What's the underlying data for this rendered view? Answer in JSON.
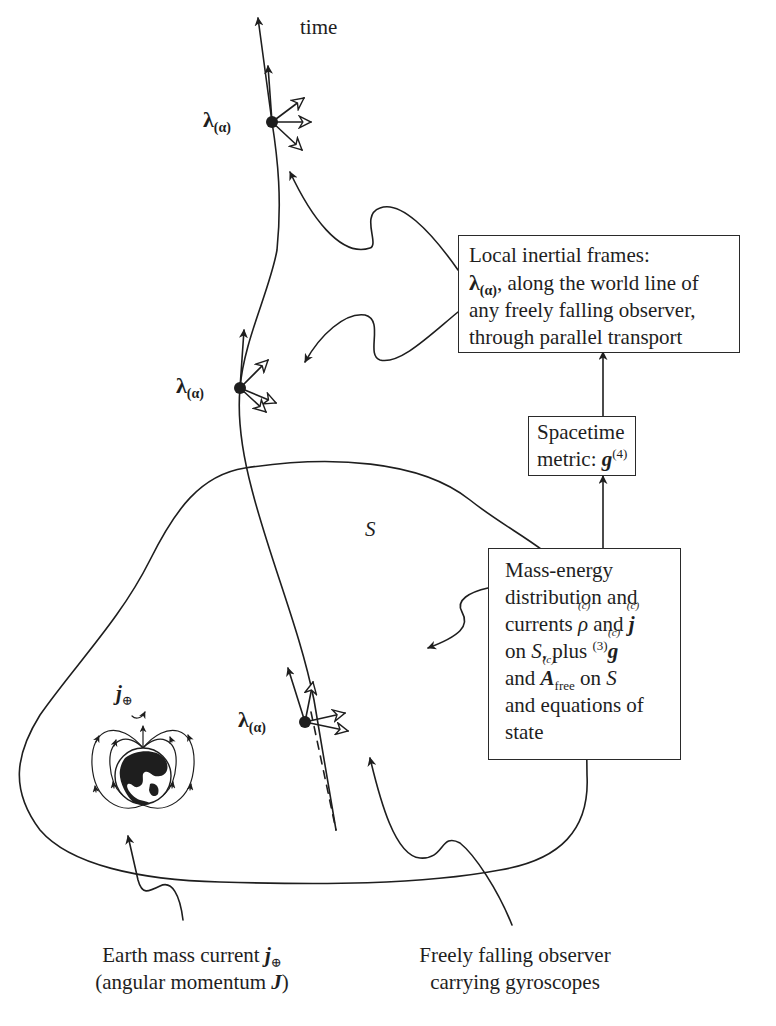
{
  "diagram": {
    "time_label": "time",
    "surface_label": "S",
    "frame_label": {
      "symbol": "λ",
      "index": "(α)"
    },
    "earth_label": {
      "symbol": "j",
      "subscript": "⊕"
    },
    "box_local_frames": {
      "line1": "Local inertial frames:",
      "line2_symbol": "λ",
      "line2_index": "(α)",
      "line2_rest": ", along the world line of",
      "line3": "any freely falling observer,",
      "line4": "through parallel transport"
    },
    "box_metric": {
      "line1": "Spacetime",
      "line2_text": "metric: ",
      "line2_symbol": "g",
      "line2_sup": "(4)"
    },
    "box_mass_energy": {
      "line1": "Mass-energy",
      "line2": "distribution and",
      "line3_text": "currents ",
      "line3_rho": "ρ",
      "line3_mid": " and ",
      "line3_j": "j",
      "accent_c": "(c)",
      "line4_text": "on ",
      "line4_S": "S",
      "line4_mid": ", plus ",
      "line4_sup": "(3)",
      "line4_g": "g",
      "line5_text": "and ",
      "line5_A": "A",
      "line5_sub": "free",
      "line5_mid": " on ",
      "line5_S": "S",
      "line6": "and equations of",
      "line7": "state"
    },
    "caption_earth": {
      "line1_text": "Earth mass current ",
      "line1_symbol": "j",
      "line1_sub": "⊕",
      "line2_text": "(angular momentum ",
      "line2_symbol": "J",
      "line2_close": ")"
    },
    "caption_observer": {
      "line1": "Freely falling observer",
      "line2": "carrying gyroscopes"
    },
    "colors": {
      "ink": "#1e1e1e",
      "background": "#ffffff"
    }
  }
}
